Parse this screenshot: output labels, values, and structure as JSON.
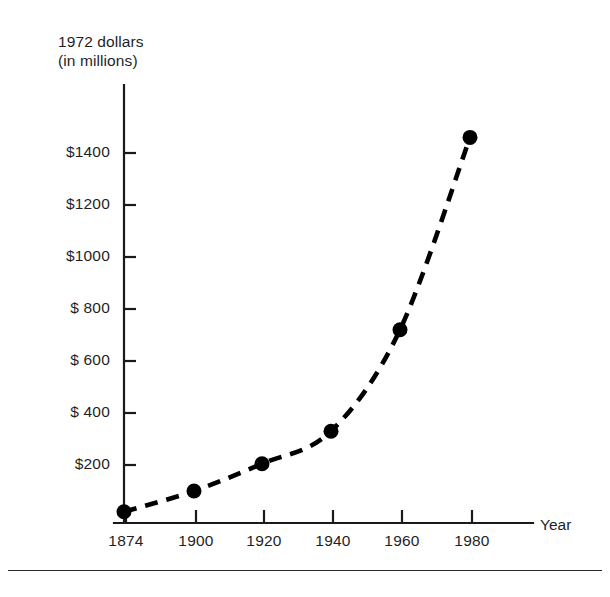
{
  "chart_data": {
    "type": "line",
    "title": "",
    "ylabel_line1": "1972 dollars",
    "ylabel_line2": "(in millions)",
    "xlabel": "Year",
    "x": [
      1874,
      1900,
      1920,
      1940,
      1960,
      1980
    ],
    "xtick_labels": [
      "1874",
      "1900",
      "1920",
      "1940",
      "1960",
      "1980"
    ],
    "values": [
      20,
      100,
      205,
      330,
      720,
      1460
    ],
    "ytick_values": [
      200,
      400,
      600,
      800,
      1000,
      1200,
      1400
    ],
    "ytick_labels": [
      "$200",
      "$ 400",
      "$ 600",
      "$ 800",
      "$1000",
      "$1200",
      "$1400"
    ],
    "ylim": [
      0,
      1520
    ],
    "xlim": [
      1866,
      1998
    ],
    "grid": false,
    "legend": null,
    "line_style": "dashed",
    "marker": "filled-circle",
    "series_color": "#000000"
  },
  "figure": {
    "background": "#ffffff",
    "axis_color": "#1a1a1a",
    "bottom_rule": true
  }
}
